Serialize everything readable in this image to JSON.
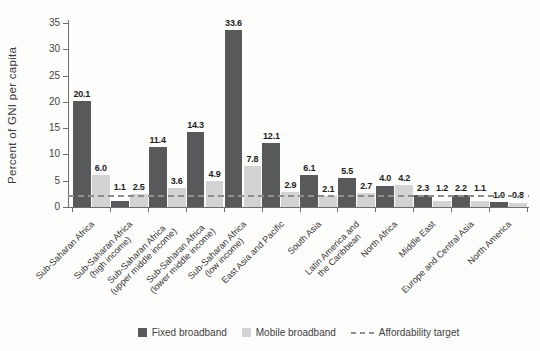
{
  "colors": {
    "fixed_broadband": "#58595b",
    "mobile_broadband": "#d1d3d4",
    "affordability_target": "#8e8e8e",
    "axis": "#6d6e70"
  },
  "chart_data": {
    "type": "bar",
    "title": "",
    "xlabel": "",
    "ylabel": "Percent of GNI per capita",
    "ylim": [
      0,
      35
    ],
    "yticks": [
      0,
      5,
      10,
      15,
      20,
      25,
      30,
      35
    ],
    "grid": false,
    "legend_position": "bottom",
    "categories": [
      "Sub-Saharan Africa",
      "Sub-Saharan Africa (high income)",
      "Sub-Saharan Africa (upper middle income)",
      "Sub-Saharan Africa (lower middle income)",
      "Sub-Saharan Africa (low income)",
      "East Asia and Pacific",
      "South Asia",
      "Latin America and the Caribbean",
      "North Africa",
      "Middle East",
      "Europe and Central Asia",
      "North America"
    ],
    "category_label_lines": [
      [
        "Sub-Saharan Africa"
      ],
      [
        "Sub-Saharan Africa",
        "(high income)"
      ],
      [
        "Sub-Saharan Africa",
        "(upper middle income)"
      ],
      [
        "Sub-Saharan Africa",
        "(lower middle income)"
      ],
      [
        "Sub-Saharan Africa",
        "(low income)"
      ],
      [
        "East Asia and Pacific"
      ],
      [
        "South Asia"
      ],
      [
        "Latin America and",
        "the Caribbean"
      ],
      [
        "North Africa"
      ],
      [
        "Middle East"
      ],
      [
        "Europe and Central Asia"
      ],
      [
        "North America"
      ]
    ],
    "series": [
      {
        "name": "Fixed broadband",
        "values": [
          20.1,
          1.1,
          11.4,
          14.3,
          33.6,
          12.1,
          6.1,
          5.5,
          4.0,
          2.3,
          2.2,
          1.0
        ]
      },
      {
        "name": "Mobile broadband",
        "values": [
          6.0,
          2.5,
          3.6,
          4.9,
          7.8,
          2.9,
          2.1,
          2.7,
          4.2,
          1.2,
          1.1,
          0.8
        ]
      }
    ],
    "target_line": {
      "label": "Affordability target",
      "value": 2
    }
  }
}
